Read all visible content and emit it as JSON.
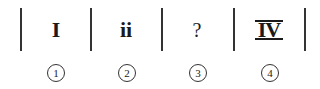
{
  "puzzle": {
    "cells": [
      {
        "symbol": "I",
        "label": "1"
      },
      {
        "symbol": "ii",
        "label": "2"
      },
      {
        "symbol": "?",
        "label": "3"
      },
      {
        "symbol": "IV",
        "label": "4"
      }
    ]
  }
}
